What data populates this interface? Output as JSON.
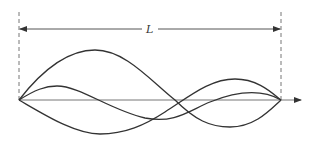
{
  "diagram": {
    "type": "standing-wave-modes",
    "dimension_label": "L",
    "colors": {
      "stroke": "#333333",
      "dashed": "#777777",
      "axis": "#777777",
      "background": "#ffffff"
    },
    "geometry": {
      "left_x": 19,
      "right_x": 281,
      "axis_y": 100,
      "axis_end_x": 301,
      "dim_y": 29
    },
    "curves": [
      {
        "name": "mode-curve-1",
        "path": "M19,100 C50,60 75,50 95,50 C125,50 150,80 175,100 C195,120 210,127 230,127 C255,127 270,110 281,100"
      },
      {
        "name": "mode-curve-2",
        "path": "M19,100 C35,90 45,86 57,86 C80,86 110,110 145,118 C175,124 190,110 210,102 C235,92 260,88 281,100"
      },
      {
        "name": "mode-curve-3",
        "path": "M19,100 C45,115 75,134 100,134 C125,134 145,125 165,112 C190,96 210,79 235,79 C258,79 272,93 281,100"
      }
    ]
  }
}
